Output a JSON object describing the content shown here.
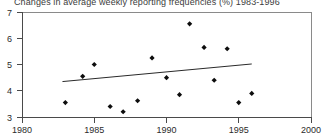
{
  "chart_data": {
    "type": "scatter",
    "title": "Changes in average weekly reporting frequencies (%) 1983-1996",
    "xlabel": "",
    "ylabel": "",
    "xlim": [
      1980,
      2000
    ],
    "ylim": [
      3,
      7
    ],
    "xticks": [
      1980,
      1985,
      1990,
      1995,
      2000
    ],
    "xtick_labels": [
      "1980",
      "1985",
      "1990",
      "1995",
      "2000"
    ],
    "yticks": [
      3,
      4,
      5,
      6,
      7
    ],
    "ytick_labels": [
      "3",
      "4",
      "5",
      "6",
      "7"
    ],
    "grid": false,
    "legend": false,
    "series": [
      {
        "name": "average weekly reporting frequency",
        "marker": "diamond",
        "points": [
          {
            "x": 1983.0,
            "y": 3.55
          },
          {
            "x": 1984.2,
            "y": 4.55
          },
          {
            "x": 1985.0,
            "y": 5.0
          },
          {
            "x": 1986.1,
            "y": 3.4
          },
          {
            "x": 1987.0,
            "y": 3.2
          },
          {
            "x": 1988.0,
            "y": 3.62
          },
          {
            "x": 1989.0,
            "y": 5.25
          },
          {
            "x": 1990.0,
            "y": 4.5
          },
          {
            "x": 1990.9,
            "y": 3.85
          },
          {
            "x": 1991.6,
            "y": 6.55
          },
          {
            "x": 1992.6,
            "y": 5.65
          },
          {
            "x": 1993.3,
            "y": 4.4
          },
          {
            "x": 1994.2,
            "y": 5.6
          },
          {
            "x": 1995.0,
            "y": 3.55
          },
          {
            "x": 1995.9,
            "y": 3.9
          }
        ]
      }
    ],
    "trend_line": {
      "name": "linear trend",
      "x_start": 1982.8,
      "y_start": 4.35,
      "x_end": 1995.9,
      "y_end": 5.02
    }
  }
}
